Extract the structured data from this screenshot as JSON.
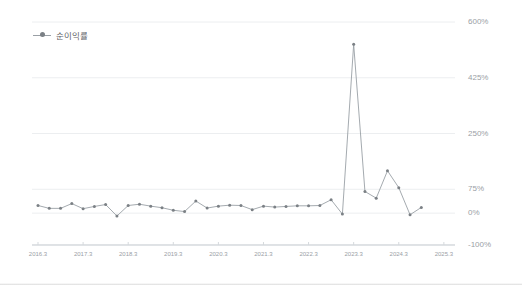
{
  "legend": {
    "series_label": "순이익률",
    "marker_color": "#7b8085",
    "line_color": "#9aa0a6"
  },
  "axis": {
    "y_ticks": [
      "600%",
      "425%",
      "250%",
      "75%",
      "0%",
      "-100%"
    ],
    "y_values": [
      600,
      425,
      250,
      75,
      0,
      -100
    ],
    "x_ticks": [
      "2016.3",
      "2017.3",
      "2018.3",
      "2019.3",
      "2020.3",
      "2021.3",
      "2022.3",
      "2023.3",
      "2024.3",
      "2025.3"
    ]
  },
  "chart_data": {
    "type": "line",
    "title": "",
    "subtitle": "",
    "xlabel": "",
    "ylabel": "",
    "ylim": [
      -100,
      600
    ],
    "grid": true,
    "legend_position": "top-left",
    "y_tick_values": [
      600,
      425,
      250,
      75,
      0,
      -100
    ],
    "y_tick_labels": [
      "600%",
      "425%",
      "250%",
      "75%",
      "0%",
      "-100%"
    ],
    "x_tick_labels": [
      "2016.3",
      "2017.3",
      "2018.3",
      "2019.3",
      "2020.3",
      "2021.3",
      "2022.3",
      "2023.3",
      "2024.3",
      "2025.3"
    ],
    "series": [
      {
        "name": "순이익률",
        "color": "#9aa0a6",
        "marker": "circle",
        "x": [
          "2016.3",
          "2016.6",
          "2016.9",
          "2016.12",
          "2017.3",
          "2017.6",
          "2017.9",
          "2017.12",
          "2018.3",
          "2018.6",
          "2018.9",
          "2018.12",
          "2019.3",
          "2019.6",
          "2019.9",
          "2019.12",
          "2020.3",
          "2020.6",
          "2020.9",
          "2020.12",
          "2021.3",
          "2021.6",
          "2021.9",
          "2021.12",
          "2022.3",
          "2022.6",
          "2022.9",
          "2022.12",
          "2023.3",
          "2023.6",
          "2023.9",
          "2023.12",
          "2024.3",
          "2024.6",
          "2024.9"
        ],
        "values": [
          24,
          15,
          15,
          30,
          14,
          21,
          27,
          -9,
          24,
          28,
          22,
          17,
          9,
          5,
          38,
          16,
          22,
          25,
          24,
          11,
          22,
          19,
          21,
          23,
          23,
          24,
          42,
          -3,
          530,
          68,
          47,
          133,
          80,
          -5,
          18
        ]
      }
    ]
  }
}
